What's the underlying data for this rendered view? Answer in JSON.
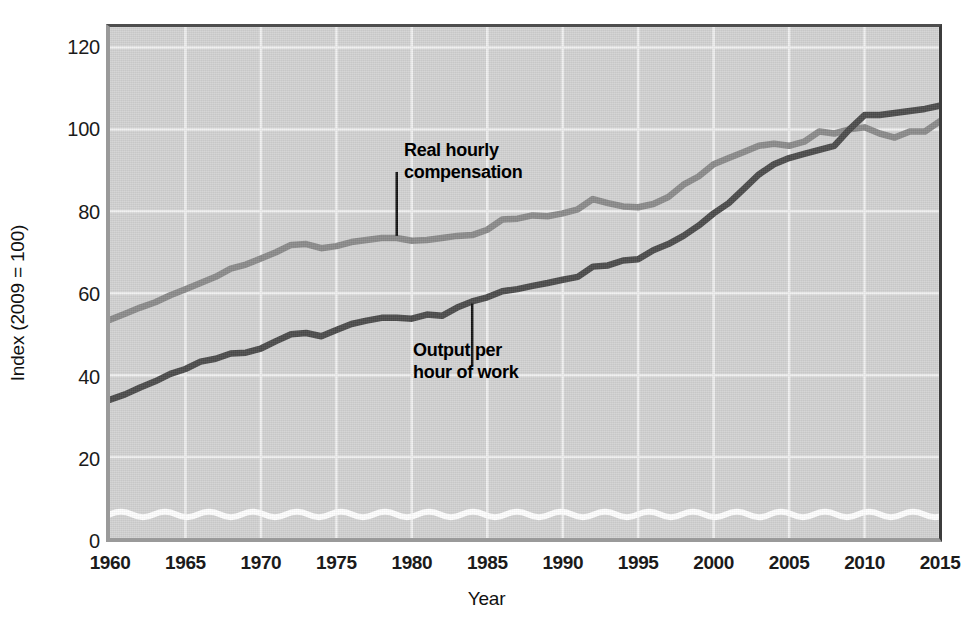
{
  "chart_data": {
    "type": "line",
    "title": "",
    "xlabel": "Year",
    "ylabel": "Index (2009 = 100)",
    "xlim": [
      1960,
      2015
    ],
    "ylim": [
      0,
      125
    ],
    "xticks": [
      1960,
      1965,
      1970,
      1975,
      1980,
      1985,
      1990,
      1995,
      2000,
      2005,
      2010,
      2015
    ],
    "yticks": [
      0,
      20,
      40,
      60,
      80,
      100,
      120
    ],
    "grid": true,
    "legend_position": "inline-annotations",
    "axis_break": true,
    "x": [
      1960,
      1961,
      1962,
      1963,
      1964,
      1965,
      1966,
      1967,
      1968,
      1969,
      1970,
      1971,
      1972,
      1973,
      1974,
      1975,
      1976,
      1977,
      1978,
      1979,
      1980,
      1981,
      1982,
      1983,
      1984,
      1985,
      1986,
      1987,
      1988,
      1989,
      1990,
      1991,
      1992,
      1993,
      1994,
      1995,
      1996,
      1997,
      1998,
      1999,
      2000,
      2001,
      2002,
      2003,
      2004,
      2005,
      2006,
      2007,
      2008,
      2009,
      2010,
      2011,
      2012,
      2013,
      2014,
      2015
    ],
    "series": [
      {
        "name": "Real hourly compensation",
        "color": "#8a8a8a",
        "values": [
          53.5,
          55.0,
          56.5,
          57.8,
          59.5,
          61.0,
          62.5,
          64.0,
          66.0,
          67.0,
          68.5,
          70.0,
          71.8,
          72.0,
          71.0,
          71.5,
          72.5,
          73.0,
          73.5,
          73.5,
          72.8,
          73.0,
          73.5,
          74.0,
          74.2,
          75.5,
          78.0,
          78.2,
          79.0,
          78.8,
          79.5,
          80.5,
          83.0,
          82.0,
          81.2,
          81.0,
          81.8,
          83.5,
          86.5,
          88.5,
          91.5,
          93.0,
          94.5,
          96.0,
          96.5,
          96.0,
          97.0,
          99.5,
          99.0,
          100.0,
          100.5,
          99.0,
          98.0,
          99.5,
          99.5,
          102.0
        ]
      },
      {
        "name": "Output per hour of work",
        "color": "#4a4a4a",
        "values": [
          34.0,
          35.3,
          37.0,
          38.5,
          40.3,
          41.5,
          43.3,
          44.0,
          45.3,
          45.5,
          46.5,
          48.3,
          50.0,
          50.3,
          49.5,
          51.0,
          52.5,
          53.3,
          54.0,
          54.0,
          53.8,
          54.8,
          54.5,
          56.5,
          58.0,
          59.0,
          60.5,
          61.0,
          61.8,
          62.5,
          63.3,
          64.0,
          66.5,
          66.8,
          68.0,
          68.3,
          70.5,
          72.0,
          74.0,
          76.5,
          79.5,
          82.0,
          85.5,
          89.0,
          91.5,
          93.0,
          94.0,
          95.0,
          96.0,
          100.0,
          103.5,
          103.5,
          104.0,
          104.5,
          105.0,
          105.8
        ]
      }
    ],
    "annotations": [
      {
        "name": "real-hourly-compensation",
        "text_line1": "Real hourly",
        "text_line2": "compensation",
        "leader_x": 1979,
        "leader_top": 1
      },
      {
        "name": "output-per-hour-of-work",
        "text_line1": "Output per",
        "text_line2": "hour of work",
        "leader_x": 1984,
        "leader_top": 0
      }
    ]
  },
  "colors": {
    "plot_background": "#d2d2d2",
    "gridline": "#f0f0f0",
    "axis": "#3c3c3c",
    "compensation_line": "#8a8a8a",
    "output_line": "#4a4a4a",
    "break_line": "#ffffff",
    "text": "#1b1b1b"
  }
}
